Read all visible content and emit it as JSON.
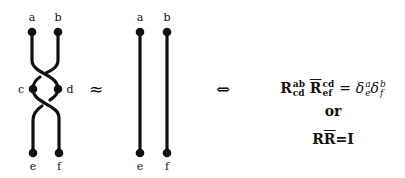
{
  "left_diagram": {
    "labels": {
      "a": "a",
      "b": "b",
      "c": "c",
      "d": "d",
      "e": "e",
      "f": "f"
    }
  },
  "middle_diagram": {
    "labels": {
      "a": "a",
      "b": "b",
      "e": "e",
      "f": "f"
    }
  },
  "symbols": {
    "approx": "≈",
    "iff": "⇔"
  },
  "equations": {
    "line1": {
      "R": "R",
      "R_sup": "ab",
      "R_sub": "cd",
      "Rbar": "R",
      "Rbar_sup": "cd",
      "Rbar_sub": "ef",
      "equals": "=",
      "delta1": "δ",
      "delta1_sup": "a",
      "delta1_sub": "e",
      "delta2": "δ",
      "delta2_sup": "b",
      "delta2_sub": "f"
    },
    "or": "or",
    "line3": {
      "R": "R",
      "Rbar": "R",
      "equals_I": "=I"
    }
  },
  "colors": {
    "stroke": "#111111",
    "background": "#ffffff"
  }
}
